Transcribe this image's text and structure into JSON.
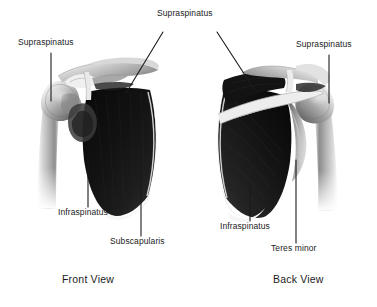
{
  "figure": {
    "background_color": "#ffffff",
    "ink_color": "#1b1b1b",
    "style": "grayscale medical illustration",
    "views": [
      {
        "id": "front",
        "caption": "Front View",
        "caption_x": 62,
        "caption_y": 275
      },
      {
        "id": "back",
        "caption": "Back View",
        "caption_x": 273,
        "caption_y": 275
      }
    ],
    "labels": [
      {
        "id": "supraspinatus-front-left",
        "text": "Supraspinatus",
        "x": 18,
        "y": 42,
        "leader": {
          "type": "vertical",
          "x1": 51,
          "y1": 53,
          "x2": 51,
          "y2": 101
        }
      },
      {
        "id": "supraspinatus-center",
        "text": "Supraspinatus",
        "x": 157,
        "y": 12,
        "leader": {
          "type": "branch",
          "x1": 163,
          "y1": 32,
          "x2": 126,
          "y2": 93,
          "x3": 217,
          "y3": 32,
          "x4": 254,
          "y4": 89
        }
      },
      {
        "id": "supraspinatus-back-right",
        "text": "Supraspinatus",
        "x": 296,
        "y": 44,
        "leader": {
          "type": "vertical",
          "x1": 329,
          "y1": 55,
          "x2": 329,
          "y2": 103
        }
      },
      {
        "id": "infraspinatus-front",
        "text": "Infraspinatus",
        "x": 58,
        "y": 210,
        "leader": {
          "type": "vertical",
          "x1": 88,
          "y1": 159,
          "x2": 88,
          "y2": 207
        }
      },
      {
        "id": "subscapularis-front",
        "text": "Subscapularis",
        "x": 110,
        "y": 239,
        "leader": {
          "type": "vertical",
          "x1": 141,
          "y1": 146,
          "x2": 141,
          "y2": 236
        }
      },
      {
        "id": "infraspinatus-back",
        "text": "Infraspinatus",
        "x": 220,
        "y": 224,
        "leader": {
          "type": "vertical",
          "x1": 250,
          "y1": 184,
          "x2": 250,
          "y2": 221
        }
      },
      {
        "id": "teres-minor-back",
        "text": "Teres minor",
        "x": 271,
        "y": 246,
        "leader": {
          "type": "vertical",
          "x1": 296,
          "y1": 160,
          "x2": 296,
          "y2": 243
        }
      }
    ]
  }
}
